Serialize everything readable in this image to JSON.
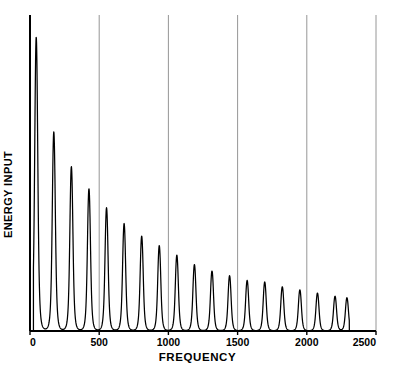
{
  "chart_data": {
    "type": "line",
    "title": "",
    "xlabel": "FREQUENCY",
    "ylabel": "ENERGY INPUT",
    "xlim": [
      0,
      2500
    ],
    "ylim": [
      0,
      100
    ],
    "xticks": [
      0,
      500,
      1000,
      1500,
      2000,
      2500
    ],
    "xtick_labels": [
      "0",
      "500",
      "1000",
      "1500",
      "2000",
      "2500"
    ],
    "yticks": [],
    "ytick_labels": [],
    "grid": "vertical",
    "gridlines_x": [
      500,
      1000,
      1500,
      2000
    ],
    "legend": "none",
    "line_color": "#000000",
    "background_color": "#ffffff",
    "border_color": "#000000",
    "gridline_color": "#8a8a8a",
    "peak_spacing": 127,
    "series": [
      {
        "name": "energy input spectrum",
        "x": [
          45,
          172,
          299,
          426,
          553,
          680,
          807,
          934,
          1061,
          1188,
          1315,
          1442,
          1569,
          1696,
          1823,
          1950,
          2077,
          2204,
          2290
        ],
        "values": [
          93,
          63,
          52,
          45,
          39,
          34,
          30,
          27,
          24,
          21,
          19,
          17.5,
          16,
          15.5,
          14,
          13,
          12,
          11,
          10.5
        ],
        "peak_half_width": 13
      }
    ],
    "baseline": 0
  },
  "axes": {
    "x_axis_name": "frequency-axis",
    "y_axis_name": "energy-input-axis"
  }
}
